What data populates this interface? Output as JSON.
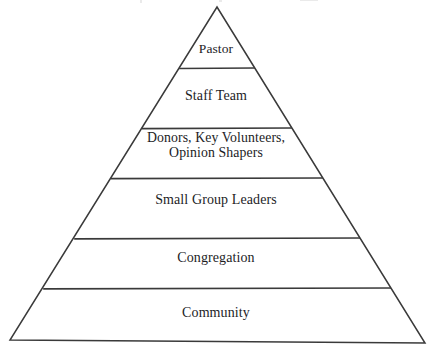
{
  "diagram": {
    "type": "pyramid",
    "title": "",
    "background_color": "#ffffff",
    "line_color": "#3a3a3a",
    "text_color": "#1d1d1f",
    "tier_count": 6,
    "apex": {
      "x": 217,
      "y": 7
    },
    "base_left": {
      "x": 10,
      "y": 340
    },
    "base_right": {
      "x": 425,
      "y": 343
    },
    "divider_y": [
      68,
      128,
      178,
      238,
      288
    ],
    "tiers": [
      {
        "index": 1,
        "label": "Pastor",
        "label_line_1": "Pastor",
        "label_line_2": ""
      },
      {
        "index": 2,
        "label": "Staff Team",
        "label_line_1": "Staff Team",
        "label_line_2": ""
      },
      {
        "index": 3,
        "label": "Donors, Key Volunteers, Opinion Shapers",
        "label_line_1": "Donors, Key Volunteers,",
        "label_line_2": "Opinion Shapers"
      },
      {
        "index": 4,
        "label": "Small Group Leaders",
        "label_line_1": "Small Group Leaders",
        "label_line_2": ""
      },
      {
        "index": 5,
        "label": "Congregation",
        "label_line_1": "Congregation",
        "label_line_2": ""
      },
      {
        "index": 6,
        "label": "Community",
        "label_line_1": "Community",
        "label_line_2": ""
      }
    ]
  }
}
